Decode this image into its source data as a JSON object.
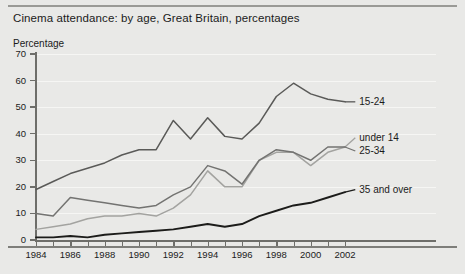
{
  "figure": {
    "title": "Cinema attendance: by age, Great Britain, percentages",
    "ylabel": "Percentage"
  },
  "chart_data": {
    "type": "line",
    "title": "Cinema attendance: by age, Great Britain, percentages",
    "xlabel": "",
    "ylabel": "Percentage",
    "xlim": [
      1984,
      2002
    ],
    "ylim": [
      0,
      70
    ],
    "grid": true,
    "legend_position": "right-inline",
    "ytick_labels": [
      "0",
      "10",
      "20",
      "30",
      "40",
      "50",
      "60",
      "70"
    ],
    "ytick_values": [
      0,
      10,
      20,
      30,
      40,
      50,
      60,
      70
    ],
    "xtick_labels": [
      "1984",
      "1986",
      "1988",
      "1990",
      "1992",
      "1994",
      "1996",
      "1998",
      "2000",
      "2002"
    ],
    "xtick_values": [
      1984,
      1986,
      1988,
      1990,
      1992,
      1994,
      1996,
      1998,
      2000,
      2002
    ],
    "x": [
      1984,
      1985,
      1986,
      1987,
      1988,
      1989,
      1990,
      1991,
      1992,
      1993,
      1994,
      1995,
      1996,
      1997,
      1998,
      1999,
      2000,
      2001,
      2002
    ],
    "series": [
      {
        "name": "15-24",
        "color": "#5a5a58",
        "values": [
          19,
          22,
          25,
          27,
          29,
          32,
          34,
          34,
          45,
          38,
          46,
          39,
          38,
          44,
          54,
          59,
          55,
          53,
          52
        ]
      },
      {
        "name": "under 14",
        "color": "#a3a3a0",
        "values": [
          4,
          5,
          6,
          8,
          9,
          9,
          10,
          9,
          12,
          17,
          26,
          20,
          20,
          30,
          33,
          33,
          28,
          33,
          35
        ]
      },
      {
        "name": "25-34",
        "color": "#737371",
        "values": [
          10,
          9,
          16,
          15,
          14,
          13,
          12,
          13,
          17,
          20,
          28,
          26,
          21,
          30,
          34,
          33,
          30,
          35,
          35
        ]
      },
      {
        "name": "35 and over",
        "color": "#1c1c1a",
        "values": [
          1,
          1,
          1.5,
          1,
          2,
          2.5,
          3,
          3.5,
          4,
          5,
          6,
          5,
          6,
          9,
          11,
          13,
          14,
          16,
          18
        ]
      }
    ],
    "series_labels": [
      {
        "text": "15-24",
        "x": 2002.6,
        "y": 52
      },
      {
        "text": "under 14",
        "x": 2002.6,
        "y": 38.5
      },
      {
        "text": "25-34",
        "x": 2002.6,
        "y": 33.5
      },
      {
        "text": "35 and over",
        "x": 2002.6,
        "y": 19
      }
    ]
  }
}
